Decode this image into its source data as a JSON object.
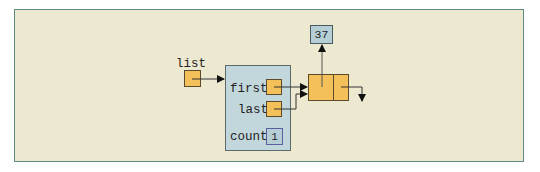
{
  "diagram": {
    "list_label": "list",
    "container": {
      "fields": [
        {
          "name": "first",
          "type": "reference"
        },
        {
          "name": "last",
          "type": "reference"
        },
        {
          "name": "count",
          "type": "value",
          "value": "1"
        }
      ]
    },
    "node": {
      "data_value": "37"
    }
  },
  "colors": {
    "frame_bg": "#ede9d0",
    "frame_border": "#5f8a84",
    "reference_fill": "#f3c05a",
    "container_fill": "#c2d7dc",
    "value_fill": "#b6cfd6"
  }
}
